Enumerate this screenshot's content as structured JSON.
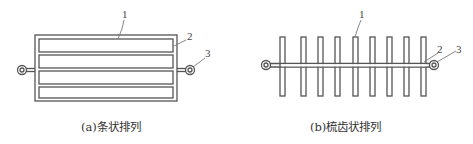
{
  "figure_a": {
    "caption": "(a)条状排列",
    "labels": {
      "l1": "1",
      "l2": "2",
      "l3": "3"
    },
    "strip_count": 4
  },
  "figure_b": {
    "caption": "(b)梳齿状排列",
    "labels": {
      "l1": "1",
      "l2": "2",
      "l3": "3"
    },
    "fin_count": 9
  },
  "colors": {
    "line": "#555555",
    "background": "#ffffff",
    "text": "#333333"
  }
}
